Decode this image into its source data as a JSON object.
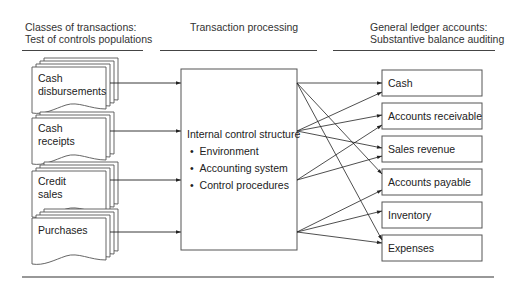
{
  "headers": {
    "left": [
      "Classes of transactions:",
      "Test of controls populations"
    ],
    "middle": "Transaction processing",
    "right": [
      "General ledger accounts:",
      "Substantive balance auditing"
    ]
  },
  "transaction_classes": [
    {
      "lines": [
        "Cash",
        "disbursements"
      ]
    },
    {
      "lines": [
        "Cash",
        "receipts"
      ]
    },
    {
      "lines": [
        "Credit",
        "sales"
      ]
    },
    {
      "lines": [
        "Purchases"
      ]
    }
  ],
  "processing": {
    "title": "Internal control structure",
    "bullets": [
      "Environment",
      "Accounting system",
      "Control procedures"
    ],
    "bullet_glyph": "•"
  },
  "accounts": [
    "Cash",
    "Accounts receivable",
    "Sales revenue",
    "Accounts payable",
    "Inventory",
    "Expenses"
  ],
  "connections": [
    {
      "from": "Cash disbursements",
      "to": [
        "Cash",
        "Accounts payable",
        "Expenses"
      ]
    },
    {
      "from": "Cash receipts",
      "to": [
        "Cash",
        "Accounts receivable",
        "Sales revenue"
      ]
    },
    {
      "from": "Credit sales",
      "to": [
        "Accounts receivable",
        "Sales revenue"
      ]
    },
    {
      "from": "Purchases",
      "to": [
        "Accounts payable",
        "Inventory",
        "Expenses"
      ]
    }
  ]
}
